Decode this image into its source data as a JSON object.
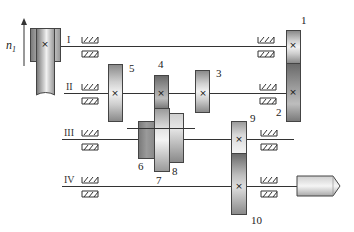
{
  "diagram": {
    "type": "gear transmission schematic",
    "input_speed_label": "n",
    "input_speed_subscript": "1",
    "shafts": [
      {
        "id": "I",
        "label": "I"
      },
      {
        "id": "II",
        "label": "II"
      },
      {
        "id": "III",
        "label": "III"
      },
      {
        "id": "IV",
        "label": "IV"
      }
    ],
    "gears": [
      {
        "id": "1",
        "label": "1",
        "shaft": "I"
      },
      {
        "id": "2",
        "label": "2",
        "shaft": "II"
      },
      {
        "id": "3",
        "label": "3",
        "shaft": "II"
      },
      {
        "id": "4",
        "label": "4",
        "shaft": "II"
      },
      {
        "id": "5",
        "label": "5",
        "shaft": "II"
      },
      {
        "id": "6",
        "label": "6",
        "shaft": "III"
      },
      {
        "id": "7",
        "label": "7",
        "shaft": "III"
      },
      {
        "id": "8",
        "label": "8",
        "shaft": "III"
      },
      {
        "id": "9",
        "label": "9",
        "shaft": "III"
      },
      {
        "id": "10",
        "label": "10",
        "shaft": "IV"
      }
    ],
    "fixed_marker": "×",
    "colors": {
      "line": "#333333",
      "gear_border": "#444444",
      "background": "#ffffff"
    }
  }
}
